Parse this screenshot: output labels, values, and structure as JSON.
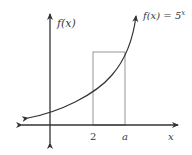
{
  "diagram": {
    "y_axis_label": "f(x)",
    "x_axis_label": "x",
    "function_label": "f(x) =  5",
    "function_exponent": "x",
    "tick_labels": [
      "2",
      "a"
    ],
    "colors": {
      "axis": "#333333",
      "curve": "#333333",
      "rectangle": "#8a8a8a",
      "text": "#3a3a3a"
    }
  }
}
